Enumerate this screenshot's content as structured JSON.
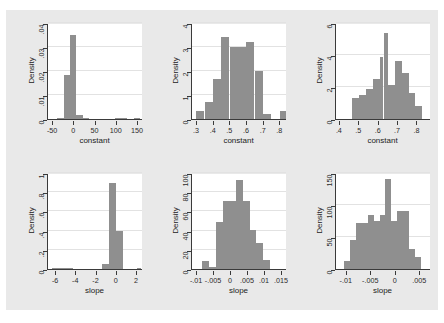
{
  "figure": {
    "background_color": "#e9e9e9",
    "bar_color": "#8f8f8f",
    "axis_color": "#3a3a3a",
    "rows": 2,
    "cols": 3
  },
  "chart_data": [
    {
      "id": "panel-1",
      "type": "bar",
      "title": "",
      "xlabel": "constant",
      "ylabel": "Density",
      "xlim": [
        -62,
        162
      ],
      "ylim": [
        0,
        0.04
      ],
      "grid": true,
      "xticks": [
        -50,
        0,
        50,
        100,
        150
      ],
      "xticklabels": [
        "-50",
        "0",
        "50",
        "100",
        "150"
      ],
      "yticks": [
        0,
        0.01,
        0.02,
        0.03,
        0.04
      ],
      "yticklabels": [
        "0",
        ".01",
        ".02",
        ".03",
        ".04"
      ],
      "bin_edges": [
        -40,
        -25,
        -10,
        5,
        20,
        35,
        50,
        65,
        80,
        95,
        110,
        125,
        140,
        155
      ],
      "values": [
        0.0004,
        0.0182,
        0.0352,
        0.0017,
        0.0002,
        0,
        0,
        0,
        0,
        0.0004,
        0.0002,
        0,
        0.0003
      ]
    },
    {
      "id": "panel-2",
      "type": "bar",
      "title": "",
      "xlabel": "constant",
      "ylabel": "Density",
      "xlim": [
        0.27,
        0.84
      ],
      "ylim": [
        0,
        4
      ],
      "grid": true,
      "xticks": [
        0.3,
        0.4,
        0.5,
        0.6,
        0.7,
        0.8
      ],
      "xticklabels": [
        ".3",
        ".4",
        ".5",
        ".6",
        ".7",
        ".8"
      ],
      "yticks": [
        0,
        1,
        2,
        3,
        4
      ],
      "yticklabels": [
        "0",
        "1",
        "2",
        "3",
        "4"
      ],
      "bin_edges": [
        0.295,
        0.345,
        0.395,
        0.445,
        0.495,
        0.545,
        0.595,
        0.645,
        0.695,
        0.745,
        0.795,
        0.835
      ],
      "values": [
        0.35,
        0.7,
        1.65,
        3.4,
        3.0,
        3.0,
        3.2,
        2.0,
        0.2,
        0.0,
        0.35
      ]
    },
    {
      "id": "panel-3",
      "type": "bar",
      "title": "",
      "xlabel": "constant",
      "ylabel": "Density",
      "xlim": [
        0.38,
        0.87
      ],
      "ylim": [
        0,
        6
      ],
      "grid": true,
      "xticks": [
        0.4,
        0.5,
        0.6,
        0.7,
        0.8
      ],
      "xticklabels": [
        ".4",
        ".5",
        ".6",
        ".7",
        ".8"
      ],
      "yticks": [
        0,
        2,
        4,
        6
      ],
      "yticklabels": [
        "0",
        "2",
        "4",
        "6"
      ],
      "bin_edges": [
        0.465,
        0.5,
        0.535,
        0.57,
        0.605,
        0.625,
        0.65,
        0.685,
        0.72,
        0.755,
        0.79,
        0.825,
        0.85
      ],
      "values": [
        1.3,
        1.5,
        1.9,
        2.5,
        3.9,
        5.4,
        2.1,
        3.6,
        2.9,
        1.6,
        0.8,
        0.0
      ]
    },
    {
      "id": "panel-4",
      "type": "bar",
      "title": "",
      "xlabel": "slope",
      "ylabel": "Density",
      "xlim": [
        -6.8,
        2.6
      ],
      "ylim": [
        0,
        1
      ],
      "grid": true,
      "xticks": [
        -6,
        -4,
        -2,
        0,
        2
      ],
      "xticklabels": [
        "-6",
        "-4",
        "-2",
        "0",
        "2"
      ],
      "yticks": [
        0,
        0.2,
        0.4,
        0.6,
        0.8,
        1
      ],
      "yticklabels": [
        "0",
        ".2",
        ".4",
        ".6",
        ".8",
        "1"
      ],
      "bin_edges": [
        -6.4,
        -5.7,
        -5.0,
        -4.3,
        -3.6,
        -2.9,
        -2.2,
        -1.5,
        -0.8,
        -0.1,
        0.6,
        1.3,
        2.0,
        2.4
      ],
      "values": [
        0.012,
        0.008,
        0.012,
        0.0,
        0.0,
        0.0,
        0.0,
        0.05,
        0.9,
        0.4,
        0.0,
        0.0,
        0.012
      ]
    },
    {
      "id": "panel-5",
      "type": "bar",
      "title": "",
      "xlabel": "slope",
      "ylabel": "Density",
      "xlim": [
        -0.0115,
        0.0165
      ],
      "ylim": [
        0,
        100
      ],
      "grid": true,
      "xticks": [
        -0.01,
        -0.005,
        0,
        0.005,
        0.01,
        0.015
      ],
      "xticklabels": [
        "-.01",
        "-.005",
        "0",
        ".005",
        ".01",
        ".015"
      ],
      "yticks": [
        0,
        20,
        40,
        60,
        80,
        100
      ],
      "yticklabels": [
        "0",
        "20",
        "40",
        "60",
        "80",
        "100"
      ],
      "bin_edges": [
        -0.0085,
        -0.0065,
        -0.0045,
        -0.0025,
        -0.0005,
        0.0015,
        0.0035,
        0.0055,
        0.0075,
        0.0095,
        0.0115,
        0.0135
      ],
      "values": [
        8,
        2,
        49,
        71,
        71,
        93,
        71,
        41,
        27,
        9,
        0
      ],
      "note": "x tick labels -.01 and -.005 are crowded together"
    },
    {
      "id": "panel-6",
      "type": "bar",
      "title": "",
      "xlabel": "slope",
      "ylabel": "Density",
      "xlim": [
        -0.0122,
        0.0072
      ],
      "ylim": [
        0,
        150
      ],
      "grid": true,
      "xticks": [
        -0.01,
        -0.005,
        0,
        0.005
      ],
      "xticklabels": [
        "-.01",
        "-.005",
        "0",
        ".005"
      ],
      "yticks": [
        0,
        50,
        100,
        150
      ],
      "yticklabels": [
        "0",
        "50",
        "100",
        "150"
      ],
      "bin_edges": [
        -0.0105,
        -0.0093,
        -0.0081,
        -0.0069,
        -0.0057,
        -0.0045,
        -0.0033,
        -0.0021,
        -0.0009,
        0.0003,
        0.0015,
        0.0027,
        0.0039,
        0.0051
      ],
      "values": [
        12,
        45,
        72,
        72,
        85,
        75,
        85,
        140,
        75,
        90,
        90,
        32,
        18
      ]
    }
  ]
}
